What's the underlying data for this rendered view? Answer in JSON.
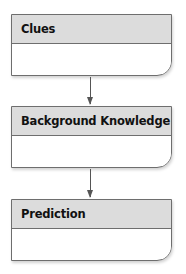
{
  "diagram": {
    "type": "flowchart",
    "direction": "top-to-bottom",
    "boxes": [
      {
        "title": "Clues",
        "content": ""
      },
      {
        "title": "Background Knowledge",
        "content": ""
      },
      {
        "title": "Prediction",
        "content": ""
      }
    ],
    "connections": [
      {
        "from": "Clues",
        "to": "Background Knowledge"
      },
      {
        "from": "Background Knowledge",
        "to": "Prediction"
      }
    ],
    "colors": {
      "header_fill": "#dcdcdc",
      "border": "#6e6e6e",
      "arrow": "#555555",
      "body_fill": "#ffffff"
    }
  }
}
